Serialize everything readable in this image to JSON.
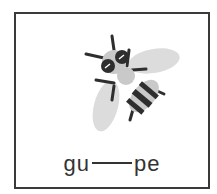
{
  "card": {
    "image": {
      "icon": "bee-icon",
      "alt": "bee"
    },
    "word": {
      "prefix": "gu",
      "blank": "",
      "suffix": "pe"
    }
  },
  "colors": {
    "border": "#3a3a3a",
    "bee_dark": "#2e2e2e",
    "bee_light": "#c9c9c9",
    "wing": "#dcdcdc"
  }
}
